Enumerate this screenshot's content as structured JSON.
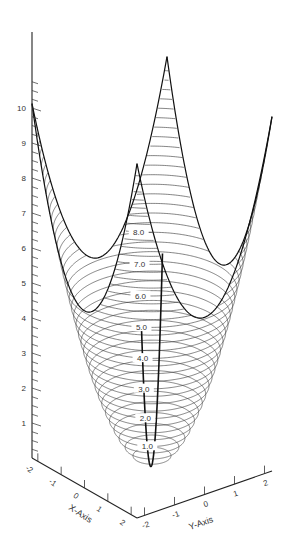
{
  "figure": {
    "z_axis": {
      "tick_labels": [
        "1",
        "2",
        "3",
        "4",
        "5",
        "6",
        "7",
        "8",
        "9",
        "10"
      ]
    },
    "x_axis": {
      "label": "X-Axis",
      "tick_labels": [
        "-2",
        "-1",
        "0",
        "1",
        "2"
      ]
    },
    "y_axis": {
      "label": "Y-Axis",
      "tick_labels": [
        "-2",
        "-1",
        "0",
        "1",
        "2"
      ]
    },
    "contour_labels": [
      "1.0",
      "2.0",
      "3.0",
      "4.0",
      "5.0",
      "6.0",
      "7.0",
      "8.0"
    ]
  },
  "chart_data": {
    "type": "surface",
    "function": "z = x^2 + y^2",
    "x_range": [
      -2.25,
      2.25
    ],
    "y_range": [
      -2.25,
      2.25
    ],
    "z_range": [
      0,
      10.5
    ],
    "xlabel": "X-Axis",
    "ylabel": "Y-Axis",
    "zlabel": "",
    "z_ticks": [
      1,
      2,
      3,
      4,
      5,
      6,
      7,
      8,
      9,
      10
    ],
    "x_ticks": [
      -2,
      -1,
      0,
      1,
      2
    ],
    "y_ticks": [
      -2,
      -1,
      0,
      1,
      2
    ],
    "contour_levels": [
      1.0,
      2.0,
      3.0,
      4.0,
      5.0,
      6.0,
      7.0,
      8.0
    ],
    "contour_spacing": 0.25,
    "grid": false
  }
}
